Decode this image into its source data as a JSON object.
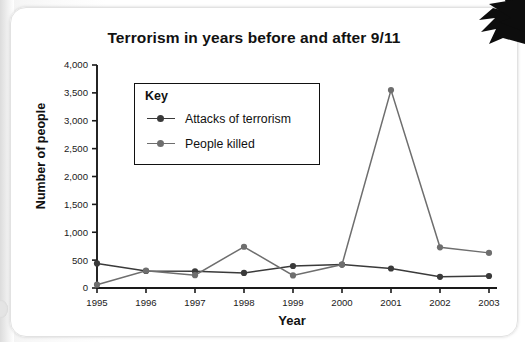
{
  "chart_data": {
    "type": "line",
    "title": "Terrorism in years before and after 9/11",
    "xlabel": "Year",
    "ylabel": "Number of people",
    "categories": [
      "1995",
      "1996",
      "1997",
      "1998",
      "1999",
      "2000",
      "2001",
      "2002",
      "2003"
    ],
    "x": [
      1995,
      1996,
      1997,
      1998,
      1999,
      2000,
      2001,
      2002,
      2003
    ],
    "ylim": [
      0,
      4000
    ],
    "ytick_labels": [
      "0",
      "500",
      "1,000",
      "1,500",
      "2,000",
      "2,500",
      "3,000",
      "3,500",
      "4,000"
    ],
    "ytick_values": [
      0,
      500,
      1000,
      1500,
      2000,
      2500,
      3000,
      3500,
      4000
    ],
    "grid": false,
    "legend_position": "inside-top-left",
    "legend_title": "Key",
    "series": [
      {
        "name": "Attacks of terrorism",
        "color": "#3a3a3a",
        "values": [
          440,
          305,
          300,
          270,
          395,
          420,
          350,
          200,
          215
        ]
      },
      {
        "name": "People killed",
        "color": "#6e6e6e",
        "values": [
          60,
          310,
          230,
          740,
          225,
          420,
          3550,
          730,
          630
        ]
      }
    ]
  },
  "decor": {
    "corner_arrow": "arrow-pointer-icon"
  }
}
